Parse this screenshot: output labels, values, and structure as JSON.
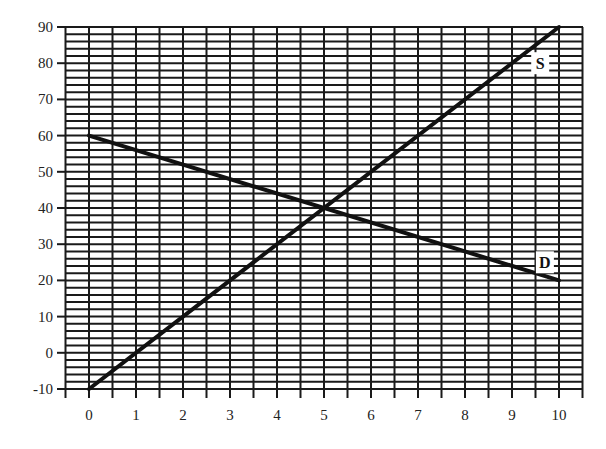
{
  "chart_data": {
    "type": "line",
    "title": "",
    "xlabel": "",
    "ylabel": "",
    "xlim": [
      0,
      10
    ],
    "ylim": [
      -10,
      90
    ],
    "x_ticks": [
      0,
      1,
      2,
      3,
      4,
      5,
      6,
      7,
      8,
      9,
      10
    ],
    "y_ticks": [
      -10,
      0,
      10,
      20,
      30,
      40,
      50,
      60,
      70,
      80,
      90
    ],
    "grid": true,
    "grid_minor_x_step": 0.5,
    "grid_minor_y_step": 2,
    "legend": "inline labels",
    "series": [
      {
        "name": "S",
        "x": [
          0,
          10
        ],
        "values": [
          -10,
          90
        ],
        "color": "#111111"
      },
      {
        "name": "D",
        "x": [
          0,
          10
        ],
        "values": [
          60,
          20
        ],
        "color": "#111111"
      }
    ],
    "annotations": [
      {
        "text": "S",
        "x": 9.6,
        "y": 80
      },
      {
        "text": "D",
        "x": 9.7,
        "y": 25
      }
    ]
  }
}
